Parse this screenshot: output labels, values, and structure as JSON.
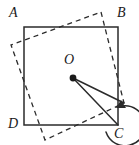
{
  "figure": {
    "width": 139,
    "height": 145,
    "background_color": "#ffffff",
    "stroke_color": "#2b2b2b",
    "labels": {
      "A": "A",
      "B": "B",
      "C": "C",
      "D": "D",
      "O": "O"
    },
    "solid_square": {
      "name": "square-ABCD",
      "style": "solid",
      "points": "24,27 118,27 118,125 24,125",
      "vertices": [
        {
          "label": "A",
          "x": 24,
          "y": 27
        },
        {
          "label": "B",
          "x": 118,
          "y": 27
        },
        {
          "label": "C",
          "x": 118,
          "y": 125
        },
        {
          "label": "D",
          "x": 24,
          "y": 125
        }
      ]
    },
    "dashed_square": {
      "name": "rotated-square",
      "style": "dashed",
      "dash_pattern": "5,4",
      "points": "101,12 124,103 45,140 11,45",
      "vertices": [
        {
          "x": 101,
          "y": 12
        },
        {
          "x": 124,
          "y": 103
        },
        {
          "x": 45,
          "y": 140
        },
        {
          "x": 11,
          "y": 45
        }
      ]
    },
    "center_point": {
      "name": "point-O",
      "x": 73,
      "y": 78,
      "radius": 3.4
    },
    "radius_lines": [
      {
        "name": "segment-O-to-C",
        "x1": 73,
        "y1": 78,
        "x2": 118,
        "y2": 125
      },
      {
        "name": "segment-O-to-C-prime",
        "x1": 73,
        "y1": 78,
        "x2": 124,
        "y2": 103
      }
    ],
    "rotation_arrow": {
      "name": "rotation-arc",
      "path": "M 106 132 A 20 20 0 1 0 122 106",
      "arrowhead": "121,100 126,108 116,108"
    }
  }
}
